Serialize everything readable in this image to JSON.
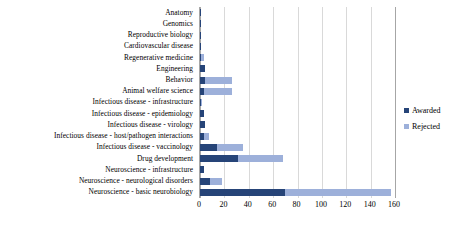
{
  "chart_data": {
    "type": "bar",
    "orientation": "horizontal",
    "stacked": true,
    "title": "",
    "subtitle": "",
    "xlabel": "",
    "ylabel": "",
    "xlim": [
      0,
      160
    ],
    "xticks": [
      "0",
      "20",
      "40",
      "60",
      "80",
      "100",
      "120",
      "140",
      "160"
    ],
    "xtick_values": [
      0,
      20,
      40,
      60,
      80,
      100,
      120,
      140,
      160
    ],
    "grid": "vertical",
    "legend_position": "right",
    "categories": [
      "Anatomy",
      "Genomics",
      "Reproductive biology",
      "Cardiovascular disease",
      "Regenerative medicine",
      "Engineering",
      "Behavior",
      "Animal welfare science",
      "Infectious disease - infrastructure",
      "Infectious disease - epidemiology",
      "Infectious disease - virology",
      "Infectious disease - host/pathogen interactions",
      "Infectious disease - vaccinology",
      "Drug development",
      "Neuroscience - infrastructure",
      "Neuroscience - neurological disorders",
      "Neuroscience - basic neurobiology"
    ],
    "series": [
      {
        "name": "Awarded",
        "color": "#264478",
        "values": [
          1,
          1,
          1,
          1,
          1,
          4,
          4,
          3,
          1,
          3,
          4,
          3,
          14,
          31,
          3,
          8,
          70
        ]
      },
      {
        "name": "Rejected",
        "color": "#9db0da",
        "values": [
          0,
          0,
          0,
          0,
          2,
          0,
          22,
          23,
          1,
          0,
          0,
          4,
          21,
          37,
          0,
          10,
          87
        ]
      }
    ]
  },
  "legend": {
    "items": [
      {
        "label": "Awarded",
        "swatch": "awarded"
      },
      {
        "label": "Rejected",
        "swatch": "rejected"
      }
    ]
  }
}
